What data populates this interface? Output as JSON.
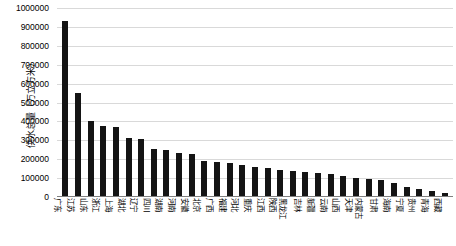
{
  "chart_data": {
    "type": "bar",
    "title": "",
    "xlabel": "",
    "ylabel": "供水总量（万立方米）",
    "ylim": [
      0,
      1000000
    ],
    "grid": true,
    "legend": false,
    "bar_color": "#141414",
    "gridline_color": "#d9d9d9",
    "y_ticks": [
      "0",
      "100000",
      "200000",
      "300000",
      "400000",
      "500000",
      "600000",
      "700000",
      "800000",
      "900000",
      "1000000"
    ],
    "y_tick_values": [
      0,
      100000,
      200000,
      300000,
      400000,
      500000,
      600000,
      700000,
      800000,
      900000,
      1000000
    ],
    "categories": [
      "广东",
      "江苏",
      "山东",
      "浙江",
      "上海",
      "湖北",
      "辽宁",
      "四川",
      "湖南",
      "河南",
      "安徽",
      "北京",
      "广西",
      "福建",
      "河北",
      "重庆",
      "江西",
      "陕西",
      "黑龙江",
      "吉林",
      "新疆",
      "云南",
      "山西",
      "天津",
      "内蒙古",
      "甘肃",
      "海南",
      "宁夏",
      "贵州",
      "青海",
      "西藏"
    ],
    "values": [
      930000,
      550000,
      400000,
      375000,
      370000,
      310000,
      305000,
      255000,
      250000,
      235000,
      225000,
      190000,
      185000,
      180000,
      170000,
      160000,
      155000,
      145000,
      140000,
      135000,
      125000,
      120000,
      110000,
      100000,
      95000,
      90000,
      75000,
      55000,
      40000,
      30000,
      20000
    ]
  }
}
